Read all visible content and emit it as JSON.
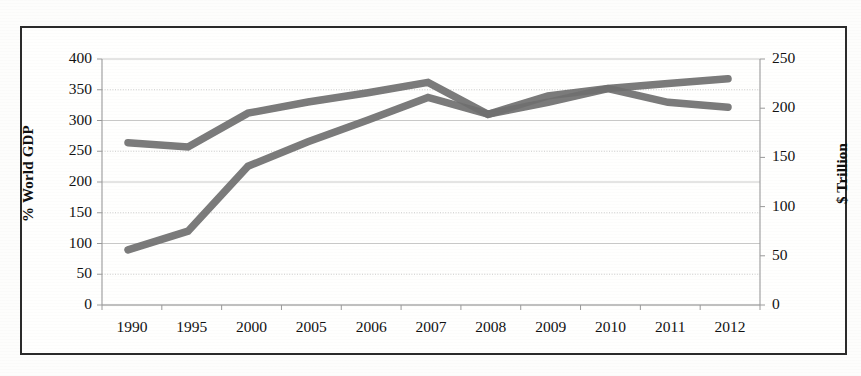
{
  "chart_data": {
    "type": "line",
    "title": "",
    "subtitle": "",
    "xlabel": "",
    "ylabel": "% World GDP",
    "y2label": "$ Trillion",
    "categories": [
      "1990",
      "1995",
      "2000",
      "2005",
      "2006",
      "2007",
      "2008",
      "2009",
      "2010",
      "2011",
      "2012"
    ],
    "ylim": [
      0,
      400
    ],
    "y2lim": [
      0,
      250
    ],
    "yticks": [
      0,
      50,
      100,
      150,
      200,
      250,
      300,
      350,
      400
    ],
    "y2ticks": [
      0,
      50,
      100,
      150,
      200,
      250
    ],
    "grid": true,
    "legend": "none",
    "series": [
      {
        "name": "% World GDP",
        "axis": "left",
        "color": "#6f6f6f",
        "values": [
          264,
          257,
          312,
          330,
          345,
          362,
          310,
          340,
          352,
          360,
          368
        ]
      },
      {
        "name": "$ Trillion",
        "axis": "right",
        "color": "#6f6f6f",
        "values": [
          56,
          75,
          141,
          166,
          188,
          211,
          194,
          206,
          220,
          206,
          201
        ]
      }
    ],
    "annotations": []
  },
  "figure": {
    "background_color": "#fdfdfc",
    "border_color": "#2b2b2b",
    "gridline_color": "#b9b9b9",
    "axis_color": "#9a9a9a",
    "line_color": "#6f6f6f",
    "text_color": "#121212"
  },
  "axes": {
    "left": {
      "title": "% World GDP",
      "ticks": [
        "400",
        "350",
        "300",
        "250",
        "200",
        "150",
        "100",
        "50",
        "0"
      ]
    },
    "right": {
      "title": "$ Trillion",
      "ticks": [
        "250",
        "200",
        "150",
        "100",
        "50",
        "0"
      ]
    },
    "bottom": {
      "ticks": [
        "1990",
        "1995",
        "2000",
        "2005",
        "2006",
        "2007",
        "2008",
        "2009",
        "2010",
        "2011",
        "2012"
      ]
    }
  }
}
